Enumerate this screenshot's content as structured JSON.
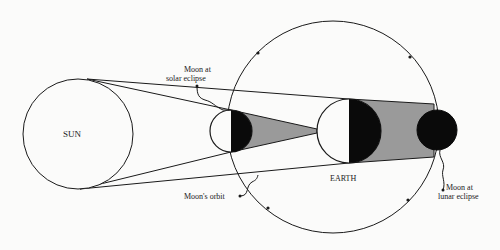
{
  "diagram": {
    "type": "eclipse-geometry",
    "labels": {
      "sun": "SUN",
      "earth": "EARTH",
      "moon_solar_line1": "Moon at",
      "moon_solar_line2": "solar eclipse",
      "moon_lunar_line1": "Moon at",
      "moon_lunar_line2": "lunar eclipse",
      "orbit": "Moon's orbit"
    },
    "colors": {
      "stroke": "#1a1a1a",
      "shadow_dark": "#0a0a0a",
      "penumbra_gray": "#9a9a9a",
      "background": "#fbfbfa"
    },
    "bodies": {
      "sun": {
        "cx": 78,
        "cy": 134,
        "r": 55
      },
      "earth": {
        "cx": 349,
        "cy": 131,
        "r": 32
      },
      "moon_solar": {
        "cx": 231,
        "cy": 131,
        "r": 21
      },
      "moon_lunar": {
        "cx": 437,
        "cy": 130,
        "r": 20
      },
      "orbit": {
        "cx": 333,
        "cy": 127,
        "r": 106
      }
    }
  }
}
